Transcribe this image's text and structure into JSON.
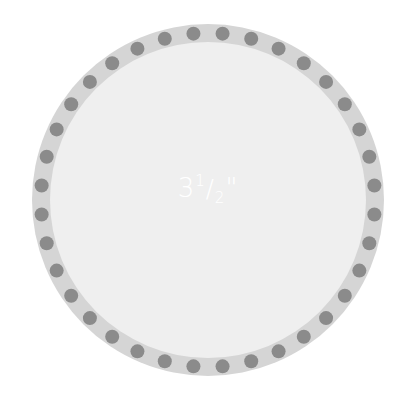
{
  "figure": {
    "label_whole": "3",
    "label_numerator": "1",
    "label_denominator": "2",
    "label_unit": "\"",
    "label_full": "3 1/2\""
  },
  "colors": {
    "background": "#ffffff",
    "inner_circle": "#efefef",
    "ring": "#d5d5d5",
    "dots": "#8b8b8b",
    "label": "#ffffff"
  },
  "geometry": {
    "center_x": 208,
    "center_y": 200,
    "outer_radius": 176,
    "ring_width": 18,
    "dot_radius": 7,
    "dot_count": 36
  }
}
